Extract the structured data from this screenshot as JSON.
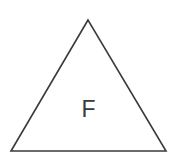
{
  "diagram": {
    "shape": "triangle",
    "label": "F",
    "stroke_color": "#3a3a3a",
    "fill_color": "#ffffff"
  }
}
